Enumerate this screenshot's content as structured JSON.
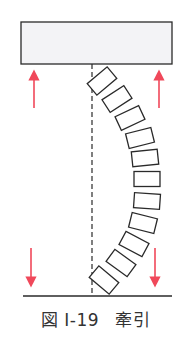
{
  "figure": {
    "caption_prefix": "図 I-19",
    "caption_title": "牽引"
  },
  "colors": {
    "line": "#2a2a2a",
    "arrow": "#f0485a",
    "plate_fill": "#f3f3f6"
  },
  "geometry": {
    "top_plate": {
      "x": 21,
      "y": 22,
      "w": 151,
      "h": 42
    },
    "dashed_axis": {
      "x": 92,
      "y1": 64,
      "y2": 296
    },
    "baseline": {
      "x1": 23,
      "x2": 172,
      "y": 296
    },
    "arrows": [
      {
        "name": "arrow-up-left",
        "x": 34,
        "y_tail": 108,
        "y_head": 75
      },
      {
        "name": "arrow-up-right",
        "x": 159,
        "y_tail": 108,
        "y_head": 75
      },
      {
        "name": "arrow-down-left",
        "x": 31,
        "y_tail": 248,
        "y_head": 282
      },
      {
        "name": "arrow-down-right",
        "x": 155,
        "y_tail": 248,
        "y_head": 282
      }
    ],
    "vertebra_blocks": [
      {
        "cx": 102,
        "cy": 81,
        "angle": -40
      },
      {
        "cx": 117,
        "cy": 99,
        "angle": -33
      },
      {
        "cx": 130,
        "cy": 118,
        "angle": -25
      },
      {
        "cx": 140,
        "cy": 138,
        "angle": -14
      },
      {
        "cx": 145,
        "cy": 158,
        "angle": -6
      },
      {
        "cx": 147,
        "cy": 179,
        "angle": 0
      },
      {
        "cx": 147,
        "cy": 201,
        "angle": 4
      },
      {
        "cx": 143,
        "cy": 223,
        "angle": 14
      },
      {
        "cx": 134,
        "cy": 244,
        "angle": 28
      },
      {
        "cx": 121,
        "cy": 263,
        "angle": 36
      },
      {
        "cx": 104,
        "cy": 280,
        "angle": 40
      }
    ],
    "block_size": {
      "w": 26,
      "h": 15
    }
  }
}
